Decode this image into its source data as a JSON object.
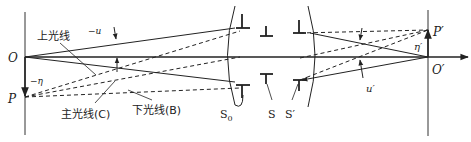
{
  "diagram": {
    "type": "optical-system-ray-diagram",
    "labels": {
      "object_axis_point": "O",
      "object_point": "P",
      "image_axis_point": "O′",
      "image_point": "P′",
      "object_height": "−η",
      "image_height": "η′",
      "object_aperture_angle": "−u",
      "image_aperture_angle": "u′",
      "upper_ray": "上光线",
      "chief_ray": "主光线(C)",
      "lower_ray": "下光线(B)",
      "entrance_pupil": "S",
      "aperture_stop": "S₀",
      "aperture_stop_base": "S",
      "aperture_stop_sub": "0",
      "exit_pupil": "S′"
    },
    "colors": {
      "stroke": "#222222",
      "background": "#ffffff"
    }
  }
}
